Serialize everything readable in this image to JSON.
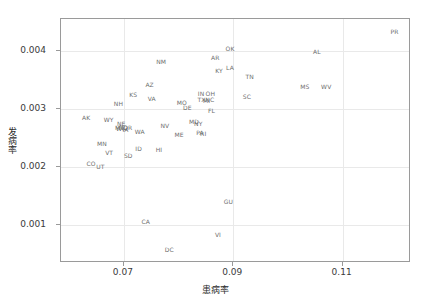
{
  "chart_data": {
    "type": "scatter",
    "title": "",
    "xlabel": "患病率",
    "ylabel": "发病率",
    "xlim": [
      0.0585,
      0.1225
    ],
    "ylim": [
      0.00035,
      0.00455
    ],
    "xticks": [
      0.07,
      0.09,
      0.11
    ],
    "xtick_labels": [
      "0.07",
      "0.09",
      "0.11"
    ],
    "yticks": [
      0.001,
      0.002,
      0.003,
      0.004
    ],
    "ytick_labels": [
      "0.001",
      "0.002",
      "0.003",
      "0.004"
    ],
    "grid": true,
    "legend": "none",
    "marker": "text-label",
    "label_color": "#6e6e6e",
    "points": [
      {
        "label": "PR",
        "x": 0.1195,
        "y": 0.00432
      },
      {
        "label": "OK",
        "x": 0.0894,
        "y": 0.00403
      },
      {
        "label": "AL",
        "x": 0.1053,
        "y": 0.00398
      },
      {
        "label": "AR",
        "x": 0.0867,
        "y": 0.00388
      },
      {
        "label": "NM",
        "x": 0.0768,
        "y": 0.00381
      },
      {
        "label": "LA",
        "x": 0.0894,
        "y": 0.0037
      },
      {
        "label": "KY",
        "x": 0.0874,
        "y": 0.00366
      },
      {
        "label": "TN",
        "x": 0.093,
        "y": 0.00355
      },
      {
        "label": "AZ",
        "x": 0.0747,
        "y": 0.00342
      },
      {
        "label": "MS",
        "x": 0.1031,
        "y": 0.00338
      },
      {
        "label": "WV",
        "x": 0.107,
        "y": 0.00338
      },
      {
        "label": "IN",
        "x": 0.0841,
        "y": 0.00326
      },
      {
        "label": "OH",
        "x": 0.0858,
        "y": 0.00326
      },
      {
        "label": "KS",
        "x": 0.0717,
        "y": 0.00324
      },
      {
        "label": "SC",
        "x": 0.0925,
        "y": 0.00321
      },
      {
        "label": "VA",
        "x": 0.0751,
        "y": 0.00317
      },
      {
        "label": "TX",
        "x": 0.0842,
        "y": 0.00316
      },
      {
        "label": "NC",
        "x": 0.0857,
        "y": 0.00315
      },
      {
        "label": "MI",
        "x": 0.0851,
        "y": 0.00314
      },
      {
        "label": "MO",
        "x": 0.0806,
        "y": 0.00311
      },
      {
        "label": "NH",
        "x": 0.069,
        "y": 0.00308
      },
      {
        "label": "DE",
        "x": 0.0816,
        "y": 0.00301
      },
      {
        "label": "FL",
        "x": 0.086,
        "y": 0.00296
      },
      {
        "label": "AK",
        "x": 0.0631,
        "y": 0.00285
      },
      {
        "label": "WY",
        "x": 0.0672,
        "y": 0.00281
      },
      {
        "label": "MD",
        "x": 0.0828,
        "y": 0.00277
      },
      {
        "label": "NY",
        "x": 0.0836,
        "y": 0.00275
      },
      {
        "label": "NE",
        "x": 0.0695,
        "y": 0.00274
      },
      {
        "label": "NV",
        "x": 0.0775,
        "y": 0.00271
      },
      {
        "label": "MT",
        "x": 0.0692,
        "y": 0.00268
      },
      {
        "label": "OR",
        "x": 0.0707,
        "y": 0.00268
      },
      {
        "label": "ND",
        "x": 0.0699,
        "y": 0.00267
      },
      {
        "label": "WI",
        "x": 0.0693,
        "y": 0.00265
      },
      {
        "label": "IA",
        "x": 0.0703,
        "y": 0.00264
      },
      {
        "label": "WA",
        "x": 0.0729,
        "y": 0.00261
      },
      {
        "label": "PA",
        "x": 0.0839,
        "y": 0.00258
      },
      {
        "label": "RI",
        "x": 0.0845,
        "y": 0.00257
      },
      {
        "label": "ME",
        "x": 0.0801,
        "y": 0.00256
      },
      {
        "label": "MN",
        "x": 0.066,
        "y": 0.0024
      },
      {
        "label": "ID",
        "x": 0.0727,
        "y": 0.00231
      },
      {
        "label": "HI",
        "x": 0.0764,
        "y": 0.00229
      },
      {
        "label": "VT",
        "x": 0.0673,
        "y": 0.00224
      },
      {
        "label": "SD",
        "x": 0.0708,
        "y": 0.00219
      },
      {
        "label": "CO",
        "x": 0.064,
        "y": 0.00205
      },
      {
        "label": "UT",
        "x": 0.0657,
        "y": 0.00201
      },
      {
        "label": "GU",
        "x": 0.0891,
        "y": 0.0014
      },
      {
        "label": "CA",
        "x": 0.074,
        "y": 0.00106
      },
      {
        "label": "VI",
        "x": 0.0872,
        "y": 0.00084
      },
      {
        "label": "DC",
        "x": 0.0783,
        "y": 0.00057
      }
    ]
  }
}
